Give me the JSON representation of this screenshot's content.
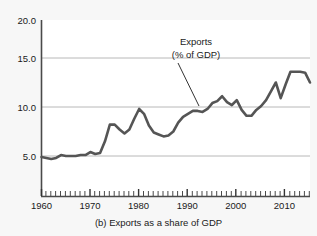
{
  "figure": {
    "caption": "(b) Exports as a share of GDP",
    "background_color": "#f7f7f7",
    "plot_background_color": "#ffffff"
  },
  "annotation": {
    "line1": "Exports",
    "line2": "(% of GDP)"
  },
  "chart_data": {
    "type": "line",
    "title": "(b) Exports as a share of GDP",
    "xlabel": "",
    "ylabel": "",
    "xlim": [
      1960,
      2015
    ],
    "ylim": [
      0,
      20
    ],
    "yticks": [
      "5.0",
      "10.0",
      "15.0",
      "20.0"
    ],
    "ytick_values": [
      5,
      10,
      15,
      20
    ],
    "xticks": [
      "1960",
      "1970",
      "1980",
      "1990",
      "2000",
      "2010"
    ],
    "xtick_values": [
      1960,
      1970,
      1980,
      1990,
      2000,
      2010
    ],
    "minor_xtick_interval": 1,
    "grid": "horizontal",
    "legend": "none",
    "line_color": "#555555",
    "line_width": 2.6,
    "annotations": [
      {
        "text": "Exports (% of GDP)",
        "x": 1988,
        "y": 16.2,
        "points_to_x": 1993,
        "points_to_y": 10.1
      }
    ],
    "series": [
      {
        "name": "Exports (% of GDP)",
        "x": [
          1960,
          1961,
          1962,
          1963,
          1964,
          1965,
          1966,
          1967,
          1968,
          1969,
          1970,
          1971,
          1972,
          1973,
          1974,
          1975,
          1976,
          1977,
          1978,
          1979,
          1980,
          1981,
          1982,
          1983,
          1984,
          1985,
          1986,
          1987,
          1988,
          1989,
          1990,
          1991,
          1992,
          1993,
          1994,
          1995,
          1996,
          1997,
          1998,
          1999,
          2000,
          2001,
          2002,
          2003,
          2004,
          2005,
          2006,
          2007,
          2008,
          2009,
          2010,
          2011,
          2012,
          2013,
          2014,
          2015
        ],
        "values": [
          4.9,
          4.8,
          4.7,
          4.8,
          5.1,
          5.0,
          5.0,
          5.0,
          5.1,
          5.1,
          5.4,
          5.2,
          5.3,
          6.5,
          8.2,
          8.2,
          7.7,
          7.3,
          7.7,
          8.8,
          9.8,
          9.3,
          8.1,
          7.4,
          7.2,
          7.0,
          7.1,
          7.5,
          8.4,
          9.0,
          9.3,
          9.6,
          9.6,
          9.5,
          9.8,
          10.4,
          10.6,
          11.1,
          10.5,
          10.2,
          10.7,
          9.7,
          9.1,
          9.1,
          9.7,
          10.1,
          10.7,
          11.6,
          12.5,
          10.9,
          12.3,
          13.6,
          13.6,
          13.6,
          13.5,
          12.5
        ]
      }
    ]
  }
}
